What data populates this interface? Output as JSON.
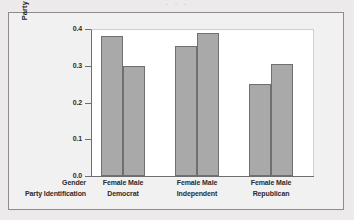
{
  "top_fragment": "· · ·",
  "axis": {
    "y_title": "Party ID Proportion",
    "y_ticks": [
      "0.4",
      "0.3",
      "0.2",
      "0.1",
      "0.0"
    ],
    "row_titles": {
      "gender": "Gender",
      "party": "Party Identification"
    }
  },
  "groups": [
    {
      "party": "Democrat",
      "female_label": "Female",
      "male_label": "Male"
    },
    {
      "party": "Independent",
      "female_label": "Female",
      "male_label": "Male"
    },
    {
      "party": "Republican",
      "female_label": "Female",
      "male_label": "Male"
    }
  ],
  "colors": {
    "bar_fill": "#a9a9a9",
    "bar_border": "#6f6f6f",
    "plot_background": "#ffffff",
    "page_background": "#eceaea"
  },
  "chart_data": {
    "type": "bar",
    "title": "",
    "xlabel": "Party Identification",
    "ylabel": "Party ID Proportion",
    "ylim": [
      0.0,
      0.4
    ],
    "yticks": [
      0.0,
      0.1,
      0.2,
      0.3,
      0.4
    ],
    "grid": false,
    "legend": "none",
    "categories": [
      "Democrat",
      "Independent",
      "Republican"
    ],
    "series": [
      {
        "name": "Female",
        "values": [
          0.38,
          0.355,
          0.25
        ]
      },
      {
        "name": "Male",
        "values": [
          0.3,
          0.39,
          0.305
        ]
      }
    ],
    "bars": [
      {
        "group": "Democrat",
        "gender": "Female",
        "value": 0.38
      },
      {
        "group": "Democrat",
        "gender": "Male",
        "value": 0.3
      },
      {
        "group": "Independent",
        "gender": "Female",
        "value": 0.355
      },
      {
        "group": "Independent",
        "gender": "Male",
        "value": 0.39
      },
      {
        "group": "Republican",
        "gender": "Female",
        "value": 0.25
      },
      {
        "group": "Republican",
        "gender": "Male",
        "value": 0.305
      }
    ]
  }
}
